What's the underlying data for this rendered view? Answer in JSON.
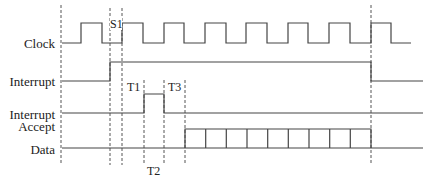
{
  "diagram": {
    "type": "timing-diagram",
    "signals": [
      {
        "id": "clock",
        "label": "Clock"
      },
      {
        "id": "interrupt",
        "label": "Interrupt"
      },
      {
        "id": "interrupt_accept",
        "label_line1": "Interrupt",
        "label_line2": "Accept"
      },
      {
        "id": "data",
        "label": "Data"
      }
    ],
    "markers": {
      "s1": "S1",
      "t1": "T1",
      "t2": "T2",
      "t3": "T3"
    },
    "data_cells": 9,
    "colors": {
      "line": "#444444",
      "text": "#222222",
      "background": "#ffffff"
    }
  }
}
